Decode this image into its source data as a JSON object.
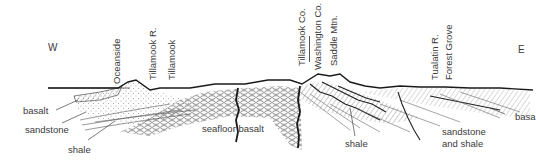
{
  "diagram": {
    "type": "geologic cross-section",
    "directions": {
      "west": "W",
      "east": "E"
    },
    "place_labels": [
      "Oceanside",
      "Tillamook R.",
      "Tillamook",
      "Tillamook Co.",
      "Washington Co.",
      "Saddle Mtn.",
      "Tualatin R.",
      "Forest Grove"
    ],
    "rock_labels": {
      "basalt_west": "basalt",
      "sandstone_west": "sandstone",
      "shale_west": "shale",
      "seafloor_basalt": "seafloor basalt",
      "shale_center": "shale",
      "sandstone_and_shale_1": "sandstone",
      "sandstone_and_shale_2": "and shale",
      "basalt_east": "basa"
    },
    "colors": {
      "ink": "#2a2a2a",
      "text": "#3a3a3a",
      "background": "#ffffff"
    }
  }
}
